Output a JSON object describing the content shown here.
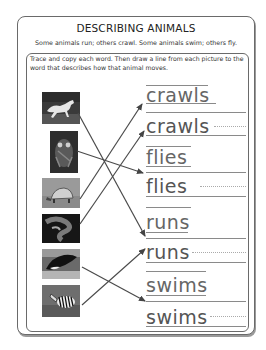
{
  "worksheet": {
    "title": "DESCRIBING ANIMALS",
    "intro": "Some animals run; others crawl.  Some animals swim; others fly.",
    "instructions": "Trace and copy each word.  Then draw a line from each picture to the word that describes how that animal moves."
  },
  "pictures": [
    {
      "animal": "horse",
      "icon": "horse-photo"
    },
    {
      "animal": "owl",
      "icon": "owl-photo"
    },
    {
      "animal": "tortoise",
      "icon": "tortoise-photo"
    },
    {
      "animal": "snake",
      "icon": "snake-photo"
    },
    {
      "animal": "orca",
      "icon": "orca-photo"
    },
    {
      "animal": "zebra",
      "icon": "zebra-photo"
    }
  ],
  "words": [
    {
      "text": "crawls",
      "style": "traced"
    },
    {
      "text": "crawls",
      "style": "copy"
    },
    {
      "text": "flies",
      "style": "traced"
    },
    {
      "text": "flies",
      "style": "copy"
    },
    {
      "text": "runs",
      "style": "traced"
    },
    {
      "text": "runs",
      "style": "copy"
    },
    {
      "text": "swims",
      "style": "traced"
    },
    {
      "text": "swims",
      "style": "copy"
    }
  ],
  "connections": [
    {
      "from": "horse",
      "to": "runs"
    },
    {
      "from": "owl",
      "to": "flies"
    },
    {
      "from": "tortoise",
      "to": "crawls"
    },
    {
      "from": "snake",
      "to": "crawls"
    },
    {
      "from": "orca",
      "to": "swims"
    },
    {
      "from": "zebra",
      "to": "runs"
    }
  ],
  "colors": {
    "ink": "#555555",
    "border": "#6a6a6a"
  }
}
